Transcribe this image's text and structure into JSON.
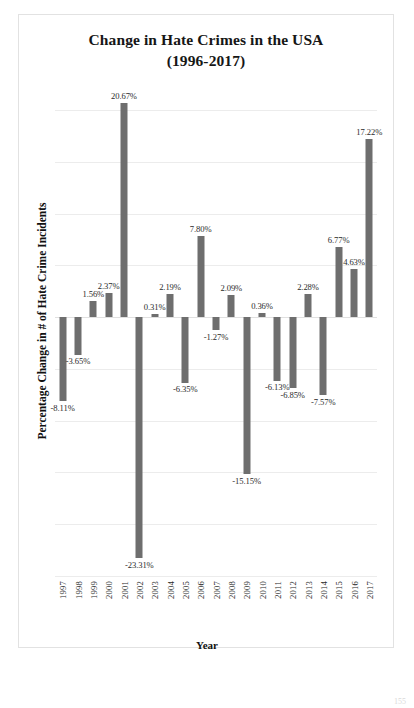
{
  "figure": {
    "title_line1": "Change in Hate Crimes in the USA",
    "title_line2": "(1996-2017)",
    "page_number": "155",
    "bar_color": "#6e6e6e",
    "grid_color": "#ececec"
  },
  "chart_data": {
    "type": "bar",
    "title": "Change in Hate Crimes in the USA (1996-2017)",
    "xlabel": "Year",
    "ylabel": "Percentage Change in # of Hate Crime Incidents",
    "categories": [
      "1997",
      "1998",
      "1999",
      "2000",
      "2001",
      "2002",
      "2003",
      "2004",
      "2005",
      "2006",
      "2007",
      "2008",
      "2009",
      "2010",
      "2011",
      "2012",
      "2013",
      "2014",
      "2015",
      "2016",
      "2017"
    ],
    "values": [
      -8.11,
      -3.65,
      1.56,
      2.37,
      20.67,
      -23.31,
      0.31,
      2.19,
      -6.35,
      7.8,
      -1.27,
      2.09,
      -15.15,
      0.36,
      -6.13,
      -6.85,
      2.28,
      -7.57,
      6.77,
      4.63,
      17.22
    ],
    "labels": [
      "-8.11%",
      "-3.65%",
      "1.56%",
      "2.37%",
      "20.67%",
      "-23.31%",
      "0.31%",
      "2.19%",
      "-6.35%",
      "7.80%",
      "-1.27%",
      "2.09%",
      "-15.15%",
      "0.36%",
      "-6.13%",
      "-6.85%",
      "2.28%",
      "-7.57%",
      "6.77%",
      "4.63%",
      "17.22%"
    ],
    "ylim": [
      -25,
      20
    ],
    "ytick_values": [
      20,
      15,
      10,
      5,
      0,
      -5,
      -10,
      -15,
      -20,
      -25
    ],
    "grid": true,
    "legend": "none",
    "series": [
      {
        "name": "Percentage Change in # of Hate Crime Incidents",
        "values": [
          -8.11,
          -3.65,
          1.56,
          2.37,
          20.67,
          -23.31,
          0.31,
          2.19,
          -6.35,
          7.8,
          -1.27,
          2.09,
          -15.15,
          0.36,
          -6.13,
          -6.85,
          2.28,
          -7.57,
          6.77,
          4.63,
          17.22
        ]
      }
    ]
  }
}
